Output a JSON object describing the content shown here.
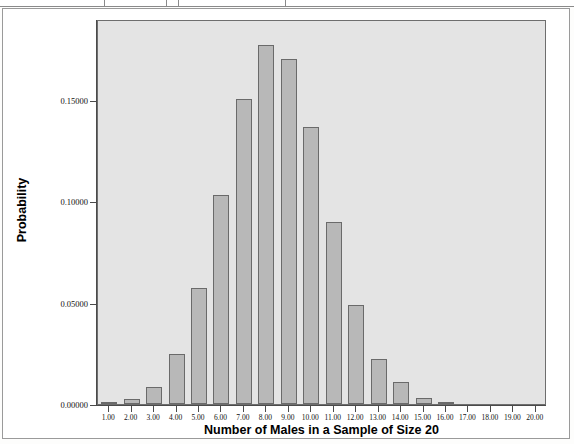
{
  "figure": {
    "background_color": "#fdfdfc",
    "panel_color": "#e4e4e4",
    "bar_fill": "#b8b8b8",
    "bar_stroke": "#6a6a6a",
    "axis_color": "#4a4a4a"
  },
  "axes": {
    "x_title": "Number of Males in a Sample of Size 20",
    "y_title": "Probability"
  },
  "chart_data": {
    "type": "bar",
    "title": "",
    "xlabel": "Number of Males in a Sample of Size 20",
    "ylabel": "Probability",
    "grid": false,
    "legend": null,
    "xlim": [
      0.5,
      20.5
    ],
    "ylim": [
      0.0,
      0.19
    ],
    "y_ticks": [
      0.0,
      0.05,
      0.1,
      0.15
    ],
    "y_tick_labels": [
      "0.00000",
      "0.05000",
      "0.10000",
      "0.15000"
    ],
    "categories": [
      "1.00",
      "2.00",
      "3.00",
      "4.00",
      "5.00",
      "6.00",
      "7.00",
      "8.00",
      "9.00",
      "10.00",
      "11.00",
      "12.00",
      "13.00",
      "14.00",
      "15.00",
      "16.00",
      "17.00",
      "18.00",
      "19.00",
      "20.00"
    ],
    "values": [
      0.0002,
      0.0009,
      0.0025,
      0.0057,
      0.0106,
      0.0172,
      0.025,
      0.0333,
      0.0407,
      0.0457,
      0.047,
      0.044,
      0.0374,
      0.0287,
      0.0196,
      0.0118,
      0.0061,
      0.0026,
      0.0008,
      0.00015
    ],
    "bar_heights": [
      0.0002,
      0.0009,
      0.0025,
      0.0057,
      0.0106,
      0.0172,
      0.025,
      0.0333,
      0.0407,
      0.0457,
      0.047,
      0.044,
      0.0374,
      0.0287,
      0.0196,
      0.0118,
      0.0061,
      0.0026,
      0.0008,
      0.00015
    ],
    "plotted_values": [
      0.0002,
      0.0009,
      0.0025,
      0.0057,
      0.0106,
      0.0172,
      0.025,
      0.0333,
      0.0407,
      0.0457,
      0.047,
      0.044,
      0.0374,
      0.0287,
      0.0196,
      0.0118,
      0.0061,
      0.0026,
      0.0008,
      0.00015
    ],
    "probabilities": [
      0.0002,
      0.00087,
      0.0025,
      0.0057,
      0.01035,
      0.0172,
      0.025,
      0.0333,
      0.0407,
      0.0457,
      0.047,
      0.044,
      0.0374,
      0.0287,
      0.0196,
      0.0118,
      0.0061,
      0.0026,
      0.0008,
      0.00015
    ],
    "series": [
      {
        "name": "Probability",
        "values": [
          0.0002,
          0.0009,
          0.0025,
          0.0057,
          0.0106,
          0.0172,
          0.025,
          0.0333,
          0.0407,
          0.0457,
          0.047,
          0.044,
          0.0374,
          0.0287,
          0.0196,
          0.0118,
          0.0061,
          0.0026,
          0.0008,
          0.00015
        ]
      }
    ]
  },
  "bars": [
    {
      "x": "1.00",
      "value": 0.0002
    },
    {
      "x": "2.00",
      "value": 0.0024
    },
    {
      "x": "3.00",
      "value": 0.0083
    },
    {
      "x": "4.00",
      "value": 0.0246
    },
    {
      "x": "5.00",
      "value": 0.0572
    },
    {
      "x": "6.00",
      "value": 0.103
    },
    {
      "x": "7.00",
      "value": 0.1504
    },
    {
      "x": "8.00",
      "value": 0.177
    },
    {
      "x": "9.00",
      "value": 0.1704
    },
    {
      "x": "10.00",
      "value": 0.1365
    },
    {
      "x": "11.00",
      "value": 0.0898
    },
    {
      "x": "12.00",
      "value": 0.049
    },
    {
      "x": "13.00",
      "value": 0.0222
    },
    {
      "x": "14.00",
      "value": 0.0107
    },
    {
      "x": "15.00",
      "value": 0.0031
    },
    {
      "x": "16.00",
      "value": 0.0005
    },
    {
      "x": "17.00",
      "value": 0.0
    },
    {
      "x": "18.00",
      "value": 0.0
    },
    {
      "x": "19.00",
      "value": 0.0
    },
    {
      "x": "20.00",
      "value": 0.0
    }
  ]
}
